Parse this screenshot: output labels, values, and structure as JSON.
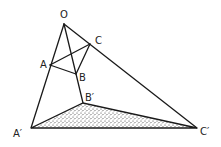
{
  "diagram": {
    "type": "projective-perspective-triangles",
    "points": {
      "O": {
        "label": "O",
        "x": 64,
        "y": 24
      },
      "A": {
        "label": "A",
        "x": 50,
        "y": 65
      },
      "B": {
        "label": "B",
        "x": 76,
        "y": 74
      },
      "C": {
        "label": "C",
        "x": 90,
        "y": 44
      },
      "A2": {
        "label": "A′",
        "x": 31,
        "y": 128
      },
      "B2": {
        "label": "B′",
        "x": 83,
        "y": 103
      },
      "C2": {
        "label": "C′",
        "x": 197,
        "y": 128
      }
    },
    "labels": {
      "O": "O",
      "A": "A",
      "B": "B",
      "C": "C",
      "A2": "A′",
      "B2": "B′",
      "C2": "C′"
    },
    "shaded_triangle": [
      "A′",
      "B′",
      "C′"
    ],
    "fill_pattern": "stipple",
    "line_color": "#1a1a1a",
    "background": "#ffffff"
  }
}
